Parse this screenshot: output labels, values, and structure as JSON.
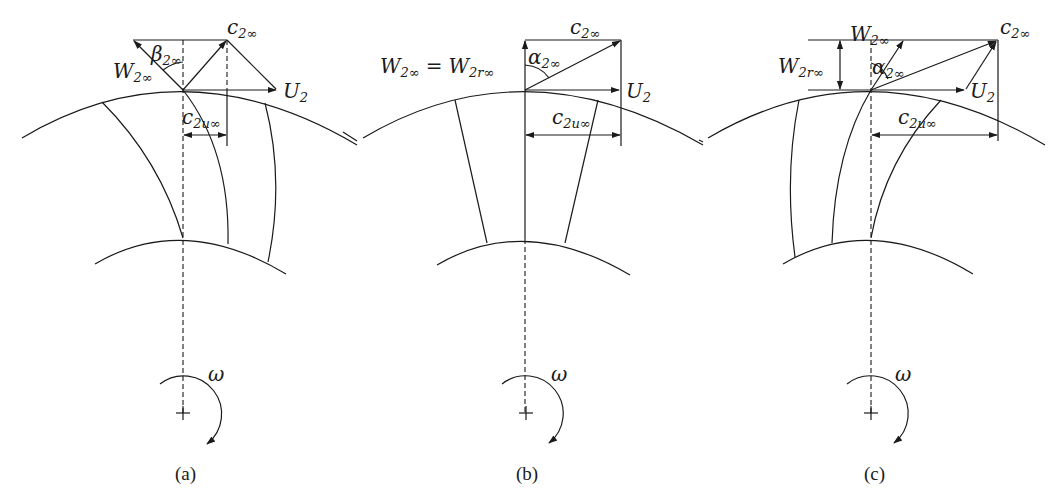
{
  "figure": {
    "panels": [
      {
        "id": "a",
        "caption": "(a)",
        "blade_type": "backward-curved",
        "labels": {
          "c2": {
            "main": "c",
            "sub": "2∞"
          },
          "w2": {
            "main": "W",
            "sub": "2∞"
          },
          "beta": {
            "main": "β",
            "sub": "2∞"
          },
          "u2": {
            "main": "U",
            "sub": "2"
          },
          "c2u": {
            "main": "c",
            "sub": "2u∞"
          },
          "omega": "ω"
        }
      },
      {
        "id": "b",
        "caption": "(b)",
        "blade_type": "radial",
        "labels": {
          "c2": {
            "main": "c",
            "sub": "2∞"
          },
          "w2_eq": {
            "main1": "W",
            "sub1": "2∞",
            "eq": "=",
            "main2": "W",
            "sub2": "2r∞"
          },
          "alpha": {
            "main": "α",
            "sub": "2∞"
          },
          "u2": {
            "main": "U",
            "sub": "2"
          },
          "c2u": {
            "main": "c",
            "sub": "2u∞"
          },
          "omega": "ω"
        }
      },
      {
        "id": "c",
        "caption": "(c)",
        "blade_type": "forward-curved",
        "labels": {
          "c2": {
            "main": "c",
            "sub": "2∞"
          },
          "w2": {
            "main": "W",
            "sub": "2∞"
          },
          "w2r": {
            "main": "W",
            "sub": "2r∞"
          },
          "alpha": {
            "main": "α",
            "sub": "2∞"
          },
          "u2": {
            "main": "U",
            "sub": "2"
          },
          "c2u": {
            "main": "c",
            "sub": "2u∞"
          },
          "omega": "ω"
        }
      }
    ]
  }
}
